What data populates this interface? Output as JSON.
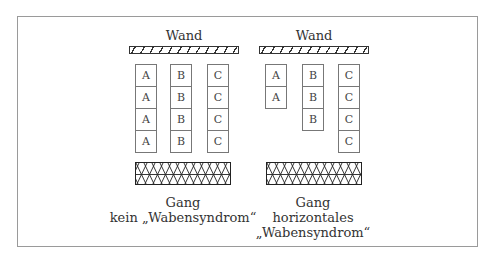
{
  "diagram": {
    "left": {
      "wall_label": "Wand",
      "columns": [
        {
          "letter": "A",
          "cells": [
            "A",
            "A",
            "A",
            "A"
          ]
        },
        {
          "letter": "B",
          "cells": [
            "B",
            "B",
            "B",
            "B"
          ]
        },
        {
          "letter": "C",
          "cells": [
            "C",
            "C",
            "C",
            "C"
          ]
        }
      ],
      "corridor_label": "Gang",
      "caption_line1": "kein „Wabensyndrom“"
    },
    "right": {
      "wall_label": "Wand",
      "columns": [
        {
          "letter": "A",
          "cells": [
            "A",
            "A"
          ]
        },
        {
          "letter": "B",
          "cells": [
            "B",
            "B",
            "B"
          ]
        },
        {
          "letter": "C",
          "cells": [
            "C",
            "C",
            "C",
            "C"
          ]
        }
      ],
      "corridor_label": "Gang",
      "caption_line1": "horizontales",
      "caption_line2": "„Wabensyndrom“"
    }
  }
}
